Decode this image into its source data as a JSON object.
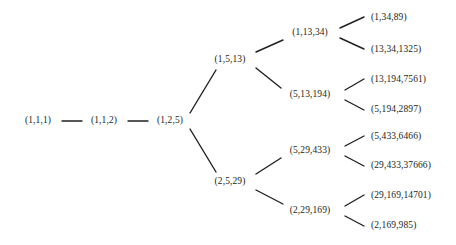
{
  "diagram": {
    "type": "binary-tree",
    "title": "",
    "edge_color": "#231f20",
    "text_color": "#231f20",
    "background": "#ffffff",
    "nodes": [
      {
        "id": "n0",
        "label": "(1,1,1)",
        "depth": 0,
        "x": 38,
        "y": 121,
        "anchor": "center"
      },
      {
        "id": "n1",
        "label": "(1,1,2)",
        "depth": 1,
        "x": 104,
        "y": 121,
        "anchor": "center"
      },
      {
        "id": "n2",
        "label": "(1,2,5)",
        "depth": 2,
        "x": 170,
        "y": 121,
        "anchor": "center"
      },
      {
        "id": "n3",
        "label": "(1,5,13)",
        "depth": 3,
        "x": 230,
        "y": 60,
        "anchor": "center"
      },
      {
        "id": "n4",
        "label": "(2,5,29)",
        "depth": 3,
        "x": 230,
        "y": 182,
        "anchor": "center"
      },
      {
        "id": "n5",
        "label": "(1,13,34)",
        "depth": 4,
        "x": 310,
        "y": 33,
        "anchor": "center"
      },
      {
        "id": "n6",
        "label": "(5,13,194)",
        "depth": 4,
        "x": 310,
        "y": 95,
        "anchor": "center"
      },
      {
        "id": "n7",
        "label": "(5,29,433)",
        "depth": 4,
        "x": 310,
        "y": 151,
        "anchor": "center"
      },
      {
        "id": "n8",
        "label": "(2,29,169)",
        "depth": 4,
        "x": 310,
        "y": 211,
        "anchor": "center"
      }
    ],
    "leaves": [
      {
        "id": "l1",
        "label": "(1,34,89)",
        "x": 371,
        "y": 18,
        "parent": "n5"
      },
      {
        "id": "l2",
        "label": "(13,34,1325)",
        "x": 371,
        "y": 50,
        "parent": "n5"
      },
      {
        "id": "l3",
        "label": "(13,194,7561)",
        "x": 371,
        "y": 80,
        "parent": "n6"
      },
      {
        "id": "l4",
        "label": "(5,194,2897)",
        "x": 371,
        "y": 110,
        "parent": "n6"
      },
      {
        "id": "l5",
        "label": "(5,433,6466)",
        "x": 371,
        "y": 137,
        "parent": "n7"
      },
      {
        "id": "l6",
        "label": "(29,433,37666)",
        "x": 371,
        "y": 166,
        "parent": "n7"
      },
      {
        "id": "l7",
        "label": "(29,169,14701)",
        "x": 371,
        "y": 196,
        "parent": "n8"
      },
      {
        "id": "l8",
        "label": "(2,169,985)",
        "x": 371,
        "y": 226,
        "parent": "n8"
      }
    ],
    "edges": [
      {
        "from": "n0",
        "to": "n1",
        "x1": 62,
        "y1": 121,
        "x2": 82,
        "y2": 121,
        "kind": "horizontal"
      },
      {
        "from": "n1",
        "to": "n2",
        "x1": 128,
        "y1": 121,
        "x2": 148,
        "y2": 121,
        "kind": "horizontal"
      },
      {
        "from": "n2",
        "to": "n3",
        "x1": 190,
        "y1": 113,
        "x2": 216,
        "y2": 70,
        "kind": "diagonal-up"
      },
      {
        "from": "n2",
        "to": "n4",
        "x1": 190,
        "y1": 129,
        "x2": 216,
        "y2": 172,
        "kind": "diagonal-down"
      },
      {
        "from": "n3",
        "to": "n5",
        "x1": 256,
        "y1": 52,
        "x2": 283,
        "y2": 40,
        "kind": "diagonal-up"
      },
      {
        "from": "n3",
        "to": "n6",
        "x1": 256,
        "y1": 68,
        "x2": 281,
        "y2": 88,
        "kind": "diagonal-down"
      },
      {
        "from": "n4",
        "to": "n7",
        "x1": 256,
        "y1": 174,
        "x2": 281,
        "y2": 158,
        "kind": "diagonal-up"
      },
      {
        "from": "n4",
        "to": "n8",
        "x1": 256,
        "y1": 190,
        "x2": 283,
        "y2": 204,
        "kind": "diagonal-down"
      },
      {
        "from": "n5",
        "to": "l1",
        "x1": 340,
        "y1": 28,
        "x2": 364,
        "y2": 17,
        "kind": "diagonal-up"
      },
      {
        "from": "n5",
        "to": "l2",
        "x1": 340,
        "y1": 38,
        "x2": 364,
        "y2": 49,
        "kind": "diagonal-down"
      },
      {
        "from": "n6",
        "to": "l3",
        "x1": 345,
        "y1": 90,
        "x2": 364,
        "y2": 79,
        "kind": "diagonal-up"
      },
      {
        "from": "n6",
        "to": "l4",
        "x1": 345,
        "y1": 100,
        "x2": 364,
        "y2": 110,
        "kind": "diagonal-down"
      },
      {
        "from": "n7",
        "to": "l5",
        "x1": 345,
        "y1": 146,
        "x2": 364,
        "y2": 136,
        "kind": "diagonal-up"
      },
      {
        "from": "n7",
        "to": "l6",
        "x1": 345,
        "y1": 156,
        "x2": 364,
        "y2": 166,
        "kind": "diagonal-down"
      },
      {
        "from": "n8",
        "to": "l7",
        "x1": 345,
        "y1": 206,
        "x2": 364,
        "y2": 195,
        "kind": "diagonal-up"
      },
      {
        "from": "n8",
        "to": "l8",
        "x1": 345,
        "y1": 216,
        "x2": 364,
        "y2": 226,
        "kind": "diagonal-down"
      }
    ]
  }
}
